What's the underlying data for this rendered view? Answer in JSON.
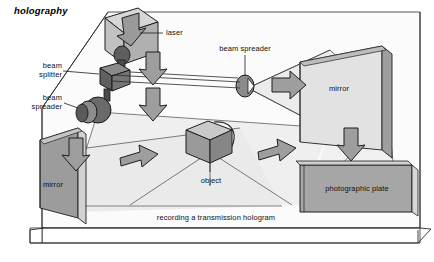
{
  "figure": {
    "title": "holography",
    "caption": "recording a transmission hologram",
    "background_color": "#ffffff",
    "line_color": "#1a1a1a"
  },
  "labels": {
    "laser": "laser",
    "beam_splitter_line1": "beam",
    "beam_splitter_line2": "splitter",
    "beam_spreader_left_line1": "beam",
    "beam_spreader_left_line2": "spreader",
    "beam_spreader_top": "beam spreader",
    "mirror_left": "mirror",
    "mirror_right": "mirror",
    "object": "object",
    "photographic_plate": "photographic plate"
  },
  "palette": {
    "base_top": "#ffffff",
    "base_edge": "#f2f2f2",
    "beam_fill": "#e8e8e8",
    "mirror_face": "#9a9a9a",
    "mirror_side": "#c8c8c8",
    "plate_face": "#a0a0a0",
    "arrow_fill": "#9e9e9e",
    "object_front": "#9c9c9c",
    "object_top": "#cfcfcf",
    "laser_body": "#b8b8b8",
    "laser_top": "#d8d8d8",
    "splitter_dark": "#6f6f6f",
    "lens_dark": "#5a5a5a",
    "outline": "#222222"
  },
  "components": [
    {
      "name": "laser",
      "kind": "box-3d",
      "has_down_arrow": true
    },
    {
      "name": "beam-splitter",
      "kind": "cube-dark"
    },
    {
      "name": "beam-spreader-left",
      "kind": "lens-disc"
    },
    {
      "name": "beam-spreader-top",
      "kind": "lens-disc"
    },
    {
      "name": "mirror-left",
      "kind": "panel"
    },
    {
      "name": "mirror-right",
      "kind": "panel"
    },
    {
      "name": "object",
      "kind": "box-3d"
    },
    {
      "name": "photographic-plate",
      "kind": "panel"
    }
  ],
  "arrows": [
    {
      "name": "arrow-laser-down",
      "direction": "down"
    },
    {
      "name": "arrow-laser-beam-down",
      "direction": "down"
    },
    {
      "name": "arrow-splitter-down",
      "direction": "down"
    },
    {
      "name": "arrow-spreader-down",
      "direction": "down"
    },
    {
      "name": "arrow-to-right-mirror",
      "direction": "right"
    },
    {
      "name": "arrow-toward-object",
      "direction": "right"
    },
    {
      "name": "arrow-object-to-plate",
      "direction": "right"
    },
    {
      "name": "arrow-plate-down",
      "direction": "down"
    }
  ]
}
